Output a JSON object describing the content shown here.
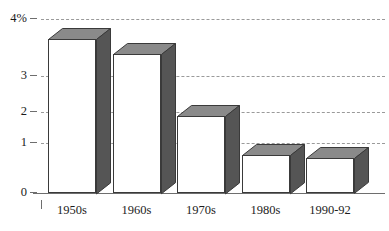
{
  "chart_data": {
    "type": "bar",
    "title": "",
    "subtitle": "",
    "xlabel": "",
    "ylabel": "",
    "categories": [
      "1950s",
      "1960s",
      "1970s",
      "1980s",
      "1990-92"
    ],
    "values": [
      3.55,
      3.2,
      1.78,
      0.88,
      0.8
    ],
    "ylim": [
      0,
      4
    ],
    "yticks": [
      0,
      1,
      2,
      3,
      4
    ],
    "ytick_labels": [
      "0",
      "1",
      "2",
      "3",
      "4%"
    ],
    "grid": true,
    "grid_style": "dashed",
    "legend": null,
    "legend_position": "none",
    "bar_style": "3d",
    "annotations": []
  },
  "axes": {
    "y": {
      "ticks": [
        {
          "label": "4%",
          "value": 4
        },
        {
          "label": "3",
          "value": 3
        },
        {
          "label": "2",
          "value": 2
        },
        {
          "label": "1",
          "value": 1
        },
        {
          "label": "0",
          "value": 0
        }
      ]
    },
    "x": {
      "ticks": [
        {
          "label": "1950s"
        },
        {
          "label": "1960s"
        },
        {
          "label": "1970s"
        },
        {
          "label": "1980s"
        },
        {
          "label": "1990-92"
        }
      ]
    }
  },
  "colors": {
    "bar_front": "#ffffff",
    "bar_top": "#8a8a8a",
    "bar_side": "#555555",
    "bar_outline": "#3a3a3a",
    "gridline": "#9a9a9a",
    "axis": "#6e6e6e",
    "text": "#1d1d1d",
    "background": "#ffffff"
  }
}
